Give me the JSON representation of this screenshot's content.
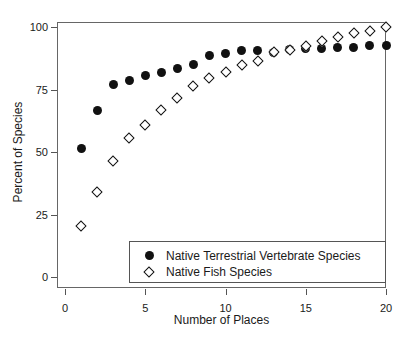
{
  "chart_data": {
    "type": "scatter",
    "title": "",
    "xlabel": "Number of Places",
    "ylabel": "Percent of Species",
    "xlim": [
      0,
      20
    ],
    "ylim": [
      0,
      100
    ],
    "xticks": [
      0,
      5,
      10,
      15,
      20
    ],
    "yticks": [
      0,
      25,
      50,
      75,
      100
    ],
    "grid": false,
    "legend_position": "bottom-right",
    "x": [
      1,
      2,
      3,
      4,
      5,
      6,
      7,
      8,
      9,
      10,
      11,
      12,
      13,
      14,
      15,
      16,
      17,
      18,
      19,
      20
    ],
    "series": [
      {
        "name": "Native Terrestrial Vertebrate Species",
        "marker": "filled-circle",
        "color": "#111111",
        "values": [
          51.5,
          66.5,
          77.0,
          78.5,
          80.5,
          82.0,
          83.5,
          85.0,
          88.5,
          89.5,
          90.5,
          90.5,
          90.0,
          91.0,
          91.5,
          91.5,
          92.0,
          92.0,
          92.5,
          92.5
        ]
      },
      {
        "name": "Native Fish Species",
        "marker": "open-diamond",
        "color": "#111111",
        "values": [
          20.5,
          34.0,
          46.5,
          55.5,
          61.0,
          67.0,
          71.5,
          76.5,
          79.5,
          82.0,
          85.0,
          86.5,
          90.0,
          91.0,
          92.5,
          94.5,
          96.0,
          97.5,
          98.5,
          100.0
        ]
      }
    ]
  },
  "axes": {
    "ytick_labels": [
      "0",
      "25",
      "50",
      "75",
      "100"
    ],
    "xtick_labels": [
      "0",
      "5",
      "10",
      "15",
      "20"
    ],
    "y_title": "Percent of Species",
    "x_title": "Number of Places"
  },
  "legend": {
    "entries": [
      {
        "label": "Native Terrestrial Vertebrate Species",
        "marker": "filled-circle"
      },
      {
        "label": "Native Fish Species",
        "marker": "open-diamond"
      }
    ]
  }
}
